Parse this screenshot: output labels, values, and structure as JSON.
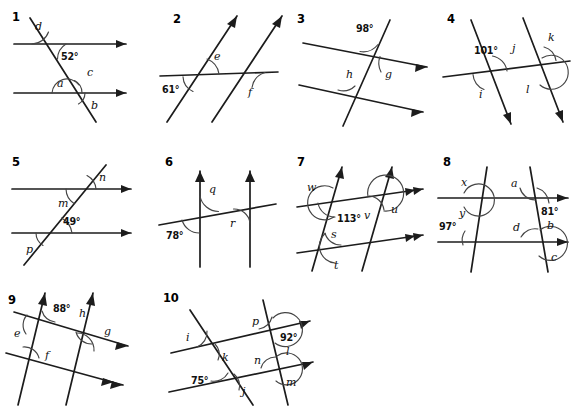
{
  "worksheet": {
    "title": "Parallel lines and transversals angle exercises",
    "problem_count": 10
  },
  "problems": [
    {
      "number": "1",
      "description": "Two horizontal parallel lines with arrows right, cut by one transversal descending left-to-right",
      "labels": [
        "d",
        "52°",
        "a",
        "c",
        "b"
      ],
      "given_angles": [
        "52°"
      ],
      "unknown_angles": [
        "a",
        "b",
        "c",
        "d"
      ],
      "parallel_lines": 2,
      "transversals": 1
    },
    {
      "number": "2",
      "description": "Two parallel transversals rising right, cut by one nearly horizontal line",
      "labels": [
        "e",
        "61°",
        "f"
      ],
      "given_angles": [
        "61°"
      ],
      "unknown_angles": [
        "e",
        "f"
      ],
      "parallel_lines": 2,
      "transversals": 1
    },
    {
      "number": "3",
      "description": "Two parallel lines sloping up to the right with arrows, cut by a steep transversal",
      "labels": [
        "98°",
        "h",
        "g"
      ],
      "given_angles": [
        "98°"
      ],
      "unknown_angles": [
        "g",
        "h"
      ],
      "parallel_lines": 2,
      "transversals": 1
    },
    {
      "number": "4",
      "description": "Two parallel transversals with downward arrows crossed by one near-horizontal line",
      "labels": [
        "101°",
        "j",
        "k",
        "i",
        "l"
      ],
      "given_angles": [
        "101°"
      ],
      "unknown_angles": [
        "i",
        "j",
        "k",
        "l"
      ],
      "parallel_lines": 2,
      "transversals": 1
    },
    {
      "number": "5",
      "description": "Two horizontal parallel lines with right arrows cut by a transversal rising to the right",
      "labels": [
        "n",
        "m",
        "49°",
        "p"
      ],
      "given_angles": [
        "49°"
      ],
      "unknown_angles": [
        "m",
        "n",
        "p"
      ],
      "parallel_lines": 2,
      "transversals": 1
    },
    {
      "number": "6",
      "description": "Two vertical parallel lines with up arrows cut by a slightly inclined transversal",
      "labels": [
        "q",
        "r",
        "78°"
      ],
      "given_angles": [
        "78°"
      ],
      "unknown_angles": [
        "q",
        "r"
      ],
      "parallel_lines": 2,
      "transversals": 1
    },
    {
      "number": "7",
      "description": "Two parallel lines with single and double arrows crossed by two parallel steep transversals",
      "labels": [
        "w",
        "113°",
        "v",
        "u",
        "s",
        "t"
      ],
      "given_angles": [
        "113°"
      ],
      "unknown_angles": [
        "s",
        "t",
        "u",
        "v",
        "w"
      ],
      "parallel_lines": 2,
      "transversals": 2
    },
    {
      "number": "8",
      "description": "Two horizontal parallel lines with right arrows crossed by two transversals",
      "labels": [
        "x",
        "a",
        "y",
        "81°",
        "97°",
        "d",
        "b",
        "c"
      ],
      "given_angles": [
        "81°",
        "97°"
      ],
      "unknown_angles": [
        "a",
        "b",
        "c",
        "d",
        "x",
        "y"
      ],
      "parallel_lines": 2,
      "transversals": 2
    },
    {
      "number": "9",
      "description": "Two parallel lines sloping up right with single and double arrows crossed by two parallel transversals with up arrows",
      "labels": [
        "88°",
        "h",
        "g",
        "e",
        "f"
      ],
      "given_angles": [
        "88°"
      ],
      "unknown_angles": [
        "e",
        "f",
        "g",
        "h"
      ],
      "parallel_lines": 2,
      "transversals": 2
    },
    {
      "number": "10",
      "description": "Two parallel lines sloping up right crossed by two parallel steep transversals",
      "labels": [
        "p",
        "92°",
        "i",
        "k",
        "n",
        "l",
        "75°",
        "j",
        "m"
      ],
      "given_angles": [
        "92°",
        "75°"
      ],
      "unknown_angles": [
        "i",
        "j",
        "k",
        "l",
        "m",
        "n",
        "p"
      ],
      "parallel_lines": 2,
      "transversals": 2
    }
  ],
  "colors": {
    "line": "#1c1c1c",
    "arc": "#444444",
    "text": "#111111",
    "background": "#ffffff"
  }
}
